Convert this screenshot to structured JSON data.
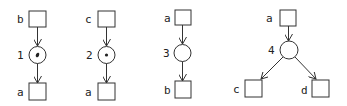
{
  "diagrams": [
    {
      "id": "net1",
      "transition_label": "1",
      "has_token": true,
      "token_glyph": "•",
      "input_place": "b",
      "output_places": [
        "a"
      ]
    },
    {
      "id": "net2",
      "transition_label": "2",
      "has_token": true,
      "token_glyph": "•",
      "input_place": "c",
      "output_places": [
        "a"
      ]
    },
    {
      "id": "net3",
      "transition_label": "3",
      "has_token": false,
      "input_place": "a",
      "output_places": [
        "b"
      ]
    },
    {
      "id": "net4",
      "transition_label": "4",
      "has_token": false,
      "input_place": "a",
      "output_places": [
        "c",
        "d"
      ]
    }
  ],
  "colors": {
    "stroke": "#333333",
    "background": "#ffffff",
    "text": "#222222"
  }
}
